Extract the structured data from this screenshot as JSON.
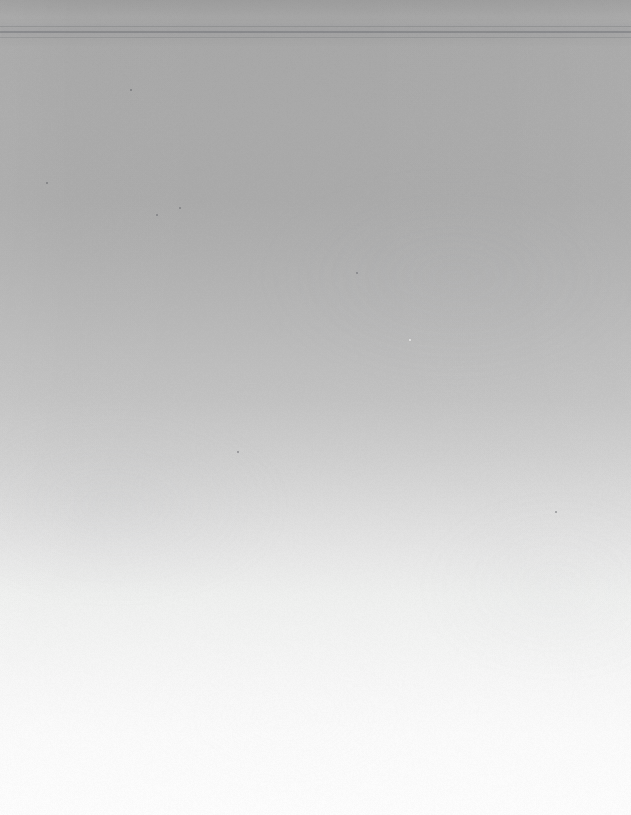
{
  "image": {
    "classification": "scanned-blank-page",
    "description": "Blank scanned page surface with smooth vertical tonal gradient from mid gray at top to near white at bottom",
    "width": 631,
    "height": 815,
    "has_text": false,
    "has_ui_elements": false
  },
  "gradient": {
    "direction": "vertical-top-to-bottom",
    "stops": [
      {
        "y": 0,
        "position_pct": 0.0,
        "color": "#9d9d9d"
      },
      {
        "y": 16,
        "position_pct": 2.0,
        "color": "#a6a6a6"
      },
      {
        "y": 30,
        "position_pct": 3.7,
        "color": "#a8a8a8"
      },
      {
        "y": 114,
        "position_pct": 14.0,
        "color": "#aaaaaa"
      },
      {
        "y": 200,
        "position_pct": 24.5,
        "color": "#ababab"
      },
      {
        "y": 253,
        "position_pct": 31.0,
        "color": "#b0b0b0"
      },
      {
        "y": 318,
        "position_pct": 39.0,
        "color": "#b8b8b8"
      },
      {
        "y": 400,
        "position_pct": 49.1,
        "color": "#c3c3c3"
      },
      {
        "y": 456,
        "position_pct": 56.0,
        "color": "#cfcfcf"
      },
      {
        "y": 509,
        "position_pct": 62.5,
        "color": "#dcdcdc"
      },
      {
        "y": 550,
        "position_pct": 67.5,
        "color": "#e6e6e6"
      },
      {
        "y": 595,
        "position_pct": 73.0,
        "color": "#eff0ef"
      },
      {
        "y": 680,
        "position_pct": 83.4,
        "color": "#f7f7f7"
      },
      {
        "y": 733,
        "position_pct": 90.0,
        "color": "#fbfbfb"
      },
      {
        "y": 815,
        "position_pct": 100.0,
        "color": "#fdfdfd"
      }
    ]
  },
  "streaks": [
    {
      "name": "scanner-streak-upper",
      "top": 26,
      "height": 1,
      "color": "rgba(96,99,104,0.26)"
    },
    {
      "name": "scanner-streak-middle",
      "top": 31,
      "height": 2,
      "color": "rgba(88,91,97,0.34)"
    },
    {
      "name": "scanner-streak-lower",
      "top": 37,
      "height": 1,
      "color": "rgba(101,104,110,0.22)"
    }
  ],
  "specks": [
    {
      "name": "dust-speck-1",
      "x": 180,
      "y": 208,
      "size": 2.4,
      "tone": "dark"
    },
    {
      "name": "dust-speck-2",
      "x": 157,
      "y": 215,
      "size": 1.8,
      "tone": "dark"
    },
    {
      "name": "dust-speck-3",
      "x": 357,
      "y": 273,
      "size": 2.6,
      "tone": "dark"
    },
    {
      "name": "dust-speck-4",
      "x": 410,
      "y": 340,
      "size": 2.0,
      "tone": "light"
    },
    {
      "name": "dust-speck-5",
      "x": 131,
      "y": 90,
      "size": 1.5,
      "tone": "dark"
    },
    {
      "name": "dust-speck-6",
      "x": 47,
      "y": 183,
      "size": 1.4,
      "tone": "dark"
    },
    {
      "name": "dust-speck-7",
      "x": 238,
      "y": 452,
      "size": 1.6,
      "tone": "dark"
    },
    {
      "name": "dust-speck-8",
      "x": 556,
      "y": 512,
      "size": 1.5,
      "tone": "dark"
    }
  ],
  "texture": {
    "type": "paper-grain",
    "opacity": 0.3,
    "most_visible_region": "lower-bright-area"
  }
}
